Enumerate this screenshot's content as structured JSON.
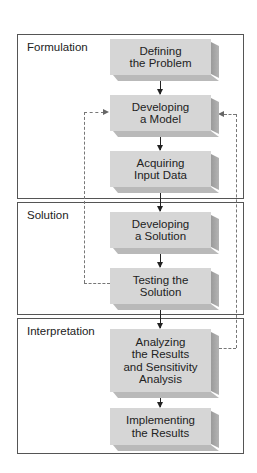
{
  "diagram": {
    "type": "flowchart",
    "sections": [
      {
        "label": "Formulation"
      },
      {
        "label": "Solution"
      },
      {
        "label": "Interpretation"
      }
    ],
    "steps": [
      {
        "line1": "Defining",
        "line2": "the Problem",
        "section": "Formulation"
      },
      {
        "line1": "Developing",
        "line2": "a Model",
        "section": "Formulation"
      },
      {
        "line1": "Acquiring",
        "line2": "Input Data",
        "section": "Formulation"
      },
      {
        "line1": "Developing",
        "line2": "a Solution",
        "section": "Solution"
      },
      {
        "line1": "Testing the",
        "line2": "Solution",
        "section": "Solution"
      },
      {
        "line1": "Analyzing",
        "line2": "the Results",
        "line3": "and Sensitivity",
        "line4": "Analysis",
        "section": "Interpretation"
      },
      {
        "line1": "Implementing",
        "line2": "the Results",
        "section": "Interpretation"
      }
    ],
    "feedback_loops": [
      {
        "from": "Testing the Solution",
        "to": "Developing a Model",
        "style": "dashed",
        "side": "left"
      },
      {
        "from": "Analyzing the Results and Sensitivity Analysis",
        "to": "Developing a Model",
        "style": "dashed",
        "side": "right"
      }
    ],
    "colors": {
      "box_face": "#d6d6d6",
      "box_side": "#9a9a9a",
      "border": "#555555",
      "dashed": "#777777"
    }
  }
}
